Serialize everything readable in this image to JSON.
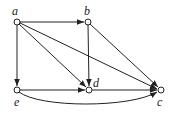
{
  "diagram": {
    "type": "directed-graph",
    "nodes": [
      {
        "id": "a",
        "label": "a",
        "x": 17,
        "y": 22
      },
      {
        "id": "b",
        "label": "b",
        "x": 88,
        "y": 22
      },
      {
        "id": "e",
        "label": "e",
        "x": 17,
        "y": 90
      },
      {
        "id": "d",
        "label": "d",
        "x": 89,
        "y": 90
      },
      {
        "id": "c",
        "label": "c",
        "x": 161,
        "y": 90
      }
    ],
    "edges": [
      {
        "from": "a",
        "to": "b"
      },
      {
        "from": "a",
        "to": "e"
      },
      {
        "from": "a",
        "to": "d"
      },
      {
        "from": "a",
        "to": "c"
      },
      {
        "from": "b",
        "to": "d"
      },
      {
        "from": "b",
        "to": "c"
      },
      {
        "from": "e",
        "to": "d"
      },
      {
        "from": "d",
        "to": "c"
      },
      {
        "from": "e",
        "to": "c",
        "curved": true
      }
    ],
    "colors": {
      "stroke": "#222222",
      "node_fill": "#ffffff"
    }
  }
}
